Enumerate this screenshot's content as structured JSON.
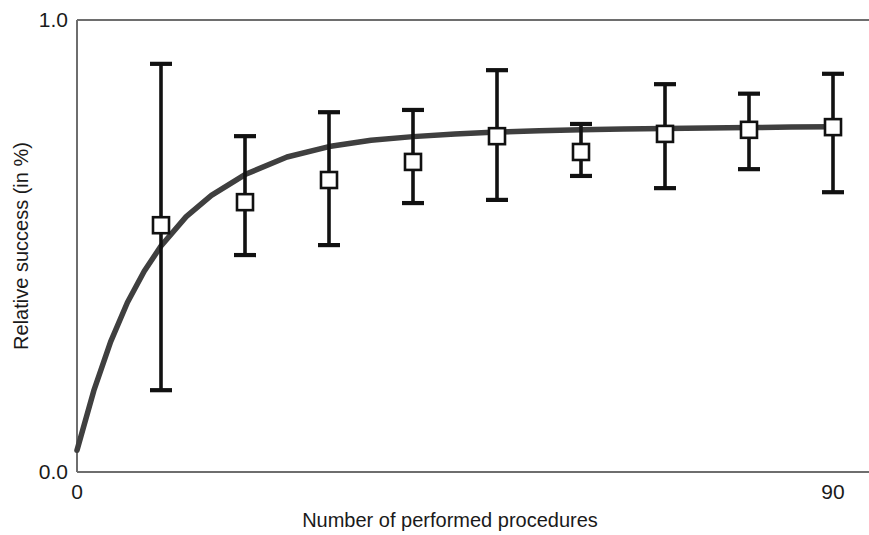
{
  "chart_data": {
    "type": "line",
    "title": "",
    "subtitle": "",
    "xlabel": "Number of performed procedures",
    "ylabel": "Relative success (in %)",
    "xlim": [
      0,
      90
    ],
    "ylim": [
      0.0,
      1.0
    ],
    "xticks": [
      0,
      90
    ],
    "xtick_labels": [
      "0",
      "90"
    ],
    "yticks": [
      0.0,
      1.0
    ],
    "ytick_labels": [
      "0.0",
      "1.0"
    ],
    "grid": false,
    "legend": "none",
    "frame": "full-box",
    "marker": "open-square",
    "series": [
      {
        "name": "Relative success",
        "x": [
          10,
          20,
          30,
          40,
          50,
          60,
          70,
          80,
          90
        ],
        "values": [
          0.546,
          0.597,
          0.646,
          0.686,
          0.743,
          0.708,
          0.748,
          0.757,
          0.763
        ],
        "err_low": [
          0.181,
          0.48,
          0.502,
          0.595,
          0.602,
          0.655,
          0.628,
          0.67,
          0.619
        ],
        "err_high": [
          0.903,
          0.743,
          0.796,
          0.801,
          0.889,
          0.77,
          0.858,
          0.837,
          0.881
        ]
      }
    ],
    "fit_curve": {
      "name": "fitted learning curve",
      "model": "asymptotic",
      "x": [
        0,
        2,
        4,
        6,
        8,
        10,
        13,
        16,
        20,
        25,
        30,
        35,
        40,
        45,
        50,
        55,
        60,
        65,
        70,
        75,
        80,
        85,
        90
      ],
      "values": [
        0.048,
        0.18,
        0.288,
        0.375,
        0.444,
        0.5,
        0.565,
        0.612,
        0.658,
        0.697,
        0.72,
        0.734,
        0.742,
        0.748,
        0.752,
        0.755,
        0.757,
        0.759,
        0.76,
        0.761,
        0.762,
        0.763,
        0.764
      ]
    },
    "colors": {
      "curve": "#3f3f3f",
      "errorbar": "#111111",
      "marker_fill": "#ffffff",
      "marker_edge": "#111111",
      "axis": "#6e6e6e",
      "text": "#1a1a1a"
    }
  },
  "axes": {
    "y_top_label": "1.0",
    "y_bottom_label": "0.0",
    "x_left_label": "0",
    "x_right_label": "90",
    "x_title": "Number of performed procedures",
    "y_title": "Relative success (in %)"
  }
}
